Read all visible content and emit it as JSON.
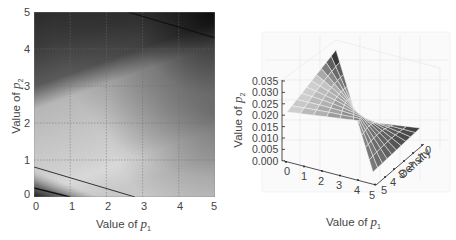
{
  "chart_data": [
    {
      "type": "heatmap",
      "title": "",
      "xlabel": "Value of p1",
      "ylabel": "Value of p2",
      "xlim": [
        0,
        5
      ],
      "ylim": [
        0,
        5
      ],
      "x_ticks": [
        "0",
        "1",
        "2",
        "3",
        "4",
        "5"
      ],
      "y_ticks": [
        "0",
        "1",
        "2",
        "3",
        "4",
        "5"
      ],
      "grid": true,
      "colormap": "grayscale",
      "description": "Grayscale density map: darkest at top-right (p1=5,p2=5) and bottom-left (p1=0,p2=0); bright diagonal band running from about p2=2.8 at p1=0 to about p2=1.5 at p1=5 and down to p2=0 near p1=3; contour lines near bottom-left and top-right",
      "contours": [
        {
          "from": [
            0,
            0.8
          ],
          "to": [
            2.8,
            0
          ]
        },
        {
          "from": [
            0,
            0.25
          ],
          "to": [
            1.0,
            0
          ]
        },
        {
          "from": [
            2.6,
            5.0
          ],
          "to": [
            5.0,
            4.3
          ]
        }
      ]
    },
    {
      "type": "surface",
      "title": "",
      "xlabel": "Value of p1",
      "ylabel": "Density",
      "zlabel": "Value of p2",
      "x_ticks": [
        "0",
        "1",
        "2",
        "3",
        "4",
        "5"
      ],
      "y_ticks": [
        "0",
        "1",
        "2",
        "3",
        "4",
        "5"
      ],
      "z_ticks": [
        "0.000",
        "0.005",
        "0.010",
        "0.015",
        "0.020",
        "0.025",
        "0.030",
        "0.035"
      ],
      "zlim": [
        0.0,
        0.035
      ],
      "grid": true,
      "colormap": "grayscale",
      "description": "Saddle-like curved surface on a 10x10 grid; max ~0.035 at p1=0, density=5 corner; ~0.021 at p1=0, density=0; near 0.000 at p1=5, density=5"
    }
  ],
  "left_plot": {
    "xlabel_prefix": "Value of ",
    "xlabel_var": "p",
    "xlabel_sub": "1",
    "ylabel_prefix": "Value of ",
    "ylabel_var": "p",
    "ylabel_sub": "2",
    "x_ticks": [
      "0",
      "1",
      "2",
      "3",
      "4",
      "5"
    ],
    "y_ticks": [
      "0",
      "1",
      "2",
      "3",
      "4",
      "5"
    ]
  },
  "right_plot": {
    "xlabel_prefix": "Value of ",
    "xlabel_var": "p",
    "xlabel_sub": "1",
    "zlabel_prefix": "Value of ",
    "zlabel_var": "p",
    "zlabel_sub": "2",
    "density_label": "Density",
    "x_ticks": [
      "0",
      "1",
      "2",
      "3",
      "4",
      "5"
    ],
    "d_ticks": [
      "0",
      "1",
      "2",
      "3",
      "4",
      "5"
    ],
    "z_ticks": [
      "0.035",
      "0.030",
      "0.025",
      "0.020",
      "0.015",
      "0.010",
      "0.005",
      "0.000"
    ]
  }
}
